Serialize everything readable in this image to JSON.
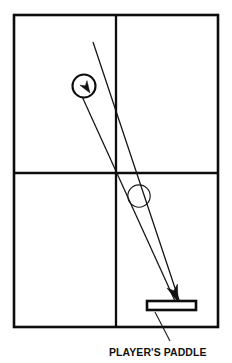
{
  "diagram": {
    "background_color": "#ffffff",
    "line_color": "#0d0d0d",
    "caption": {
      "label": "PLAYER'S PADDLE",
      "x": 109,
      "y": 356
    },
    "court": {
      "name": "playing-field",
      "x": 14,
      "y": 15,
      "width": 204,
      "height": 312,
      "stroke_width": 2.6,
      "vertical_divider_x": 116,
      "horizontal_divider_y": 173
    },
    "ball_top": {
      "name": "ball-upper",
      "cx": 84,
      "cy": 86,
      "r": 11.5,
      "stroke_width": 2.1
    },
    "ball_mid": {
      "name": "ball-mid",
      "cx": 139,
      "cy": 196,
      "r": 11.2,
      "stroke_width": 1.15
    },
    "trajectory_incoming": {
      "name": "incoming-trajectory",
      "x1": 93,
      "y1": 42,
      "x2": 180,
      "y2": 303
    },
    "trajectory_outgoing": {
      "name": "outgoing-trajectory",
      "x1": 80,
      "y1": 92,
      "x2": 175,
      "y2": 301
    },
    "arrow_top": {
      "name": "ball-direction-arrow",
      "tip_x": 90,
      "tip_y": 93,
      "angle_deg": 57
    },
    "arrow_bottom": {
      "name": "impact-arrow",
      "tip_x": 178,
      "tip_y": 302,
      "angle_deg": 70
    },
    "paddle": {
      "name": "players-paddle",
      "x": 147,
      "y": 301,
      "width": 49,
      "height": 9,
      "stroke_width": 2.6,
      "fill": "#ffffff"
    },
    "leader_line": {
      "name": "caption-leader-line",
      "x1": 155,
      "y1": 312,
      "x2": 170,
      "y2": 341
    }
  }
}
